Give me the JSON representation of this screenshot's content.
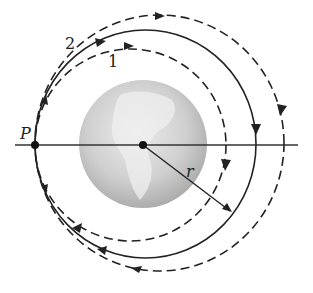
{
  "diagram": {
    "title": "",
    "labels": {
      "point_p": "P",
      "orbit_1": "1",
      "orbit_2": "2",
      "radius": "r"
    },
    "colors": {
      "line": "#222222",
      "earth_dark": "#a8a8a8",
      "earth_light": "#e6e6e6",
      "background": "#ffffff"
    },
    "orbits": [
      {
        "id": "inner-dashed",
        "style": "dashed",
        "label": "1"
      },
      {
        "id": "middle-solid",
        "style": "solid",
        "label": "2"
      },
      {
        "id": "outer-dashed",
        "style": "dashed",
        "label": ""
      }
    ]
  }
}
